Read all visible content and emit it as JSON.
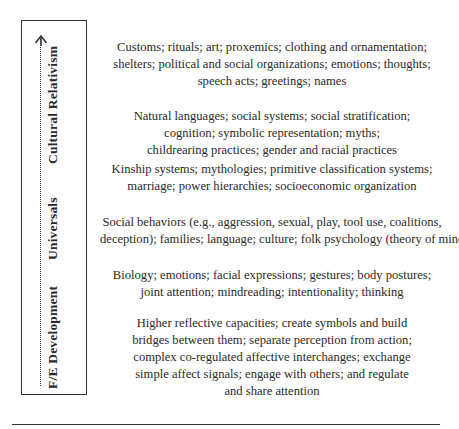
{
  "axis": {
    "arrow_direction": "up",
    "labels": {
      "cultural_relativism": "Cultural Relativism",
      "universals": "Universals",
      "fe_development": "F/E Development"
    }
  },
  "blocks": [
    {
      "lines": [
        "Customs; rituals; art; proxemics; clothing and ornamentation;",
        "shelters; political and social organizations; emotions; thoughts;",
        "speech acts; greetings; names"
      ]
    },
    {
      "lines": [
        "Natural languages; social systems; social stratification;",
        "cognition; symbolic representation; myths;",
        "childrearing practices; gender and racial practices"
      ]
    },
    {
      "lines": [
        "Kinship systems; mythologies; primitive classification systems;",
        "marriage; power hierarchies; socioeconomic organization"
      ]
    },
    {
      "lines": [
        "Social behaviors (e.g., aggression, sexual, play, tool use, coalitions,",
        "deception); families; language; culture; folk psychology (theory of mind)"
      ]
    },
    {
      "lines": [
        "Biology; emotions; facial expressions; gestures; body postures;",
        "joint attention; mindreading; intentionality; thinking"
      ]
    },
    {
      "lines": [
        "Higher reflective capacities; create symbols and build",
        "bridges between them; separate perception from action;",
        "complex co-regulated affective interchanges; exchange",
        "simple affect signals; engage with others; and regulate",
        "and share attention"
      ]
    }
  ],
  "colors": {
    "text": "#2a2a2a",
    "lines": "#333333",
    "background": "#ffffff"
  }
}
